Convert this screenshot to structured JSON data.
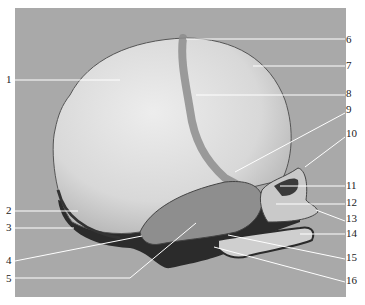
{
  "figure": {
    "colors": {
      "background_panel": "#a9a9a9",
      "page": "#ffffff",
      "bone": "#dcdcdc",
      "suture": "#8a8a8a",
      "shadow": "#2a2a2a",
      "leader_line": "#ffffff"
    },
    "labels": [
      {
        "num": "1",
        "side": "left",
        "y": 79,
        "line": [
          [
            15,
            80
          ],
          [
            120,
            80
          ]
        ]
      },
      {
        "num": "2",
        "side": "left",
        "y": 210,
        "line": [
          [
            15,
            211
          ],
          [
            78,
            211
          ]
        ]
      },
      {
        "num": "3",
        "side": "left",
        "y": 227,
        "line": [
          [
            15,
            228
          ],
          [
            74,
            228
          ]
        ]
      },
      {
        "num": "4",
        "side": "left",
        "y": 260,
        "line": [
          [
            15,
            261
          ],
          [
            142,
            236
          ]
        ]
      },
      {
        "num": "5",
        "side": "left",
        "y": 278,
        "line": [
          [
            15,
            278
          ],
          [
            130,
            278
          ],
          [
            196,
            223
          ]
        ]
      },
      {
        "num": "6",
        "side": "right",
        "y": 39,
        "line": [
          [
            186,
            39
          ],
          [
            345,
            39
          ]
        ]
      },
      {
        "num": "7",
        "side": "right",
        "y": 65,
        "line": [
          [
            253,
            66
          ],
          [
            345,
            66
          ]
        ]
      },
      {
        "num": "8",
        "side": "right",
        "y": 93,
        "line": [
          [
            196,
            95
          ],
          [
            345,
            95
          ]
        ]
      },
      {
        "num": "9",
        "side": "right",
        "y": 109,
        "line": [
          [
            235,
            172
          ],
          [
            345,
            113
          ]
        ]
      },
      {
        "num": "10",
        "side": "right",
        "y": 133,
        "line": [
          [
            305,
            167
          ],
          [
            345,
            137
          ]
        ]
      },
      {
        "num": "11",
        "side": "right",
        "y": 185,
        "line": [
          [
            280,
            186
          ],
          [
            345,
            186
          ]
        ]
      },
      {
        "num": "12",
        "side": "right",
        "y": 202,
        "line": [
          [
            276,
            204
          ],
          [
            345,
            204
          ]
        ]
      },
      {
        "num": "13",
        "side": "right",
        "y": 218,
        "line": [
          [
            316,
            210
          ],
          [
            345,
            221
          ]
        ]
      },
      {
        "num": "14",
        "side": "right",
        "y": 233,
        "line": [
          [
            300,
            234
          ],
          [
            345,
            234
          ]
        ]
      },
      {
        "num": "15",
        "side": "right",
        "y": 257,
        "line": [
          [
            228,
            235
          ],
          [
            345,
            259
          ]
        ]
      },
      {
        "num": "16",
        "side": "right",
        "y": 280,
        "line": [
          [
            214,
            247
          ],
          [
            345,
            282
          ]
        ]
      }
    ]
  }
}
